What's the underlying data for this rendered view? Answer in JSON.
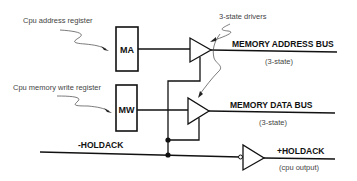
{
  "diagram": {
    "annotations": {
      "address_register": "Cpu address register",
      "write_register": "Cpu memory write register",
      "drivers": "3-state drivers"
    },
    "registers": {
      "ma": "MA",
      "mw": "MW"
    },
    "buses": {
      "address_bus": "MEMORY ADDRESS BUS",
      "address_bus_note": "(3-state)",
      "data_bus": "MEMORY DATA  BUS",
      "data_bus_note": "(3-state)"
    },
    "signals": {
      "holdack_in": "-HOLDACK",
      "holdack_out": "+HOLDACK",
      "holdack_out_note": "(cpu output)"
    },
    "colors": {
      "ink": "#111111",
      "background": "#ffffff"
    }
  }
}
